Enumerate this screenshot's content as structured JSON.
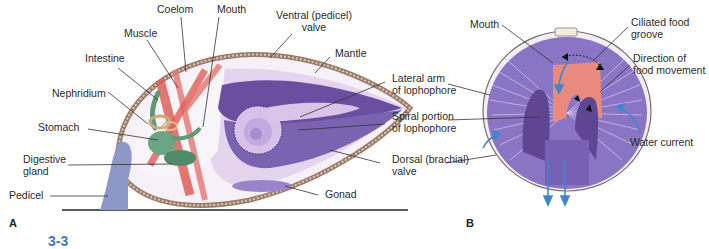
{
  "figure": {
    "figure_number_partial": "3-3",
    "panels": [
      {
        "id": "A",
        "letter": "A",
        "description": "Lateral cross-section of a brachiopod",
        "labels": {
          "coelom": "Coelom",
          "mouth": "Mouth",
          "ventral_valve": "Ventral (pedicel)\nvalve",
          "muscle": "Muscle",
          "intestine": "Intestine",
          "mantle": "Mantle",
          "nephridium": "Nephridium",
          "lateral_arm": "Lateral arm\nof lophophore",
          "stomach": "Stomach",
          "spiral_portion": "Spiral portion\nof lophophore",
          "digestive_gland": "Digestive\ngland",
          "dorsal_valve": "Dorsal (brachial)\nvalve",
          "pedicel": "Pedicel",
          "gonad": "Gonad"
        }
      },
      {
        "id": "B",
        "letter": "B",
        "description": "Ventral view of lophophore showing food and water flow",
        "labels": {
          "mouth": "Mouth",
          "ciliated_groove": "Ciliated food\ngroove",
          "food_direction": "Direction of\nfood movement",
          "water_current": "Water current"
        }
      }
    ],
    "colors": {
      "shell": "#b89a86",
      "shell_dark": "#7a5a48",
      "mantle_light": "#e4d4ee",
      "lophophore": "#6a4fa0",
      "lophophore_light": "#c9b3e4",
      "muscle": "#e0605a",
      "gut": "#5d9a78",
      "pedicel": "#8d98c8",
      "arrow_blue": "#3f86cc",
      "groove_pink": "#e88a80",
      "label_line": "#333333",
      "fig_number": "#3b78c4"
    }
  }
}
